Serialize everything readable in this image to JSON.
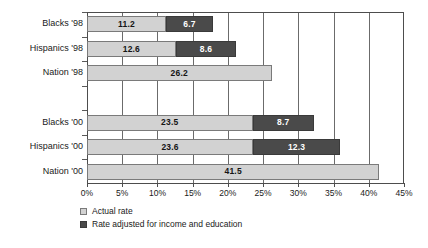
{
  "chart_data": {
    "type": "bar",
    "orientation": "horizontal",
    "stacked": true,
    "title": "",
    "xlabel": "",
    "ylabel": "",
    "xlim": [
      0,
      45
    ],
    "xticks": [
      0,
      5,
      10,
      15,
      20,
      25,
      30,
      35,
      40,
      45
    ],
    "xticklabels": [
      "0%",
      "5%",
      "10%",
      "15%",
      "20%",
      "25%",
      "30%",
      "35%",
      "40%",
      "45%"
    ],
    "grid": true,
    "legend_position": "below-axis-left",
    "categories": [
      "Blacks '98",
      "Hispanics '98",
      "Nation  '98",
      "",
      "Blacks '00",
      "Hispanics '00",
      "Nation '00"
    ],
    "series": [
      {
        "name": "Actual rate",
        "color": "#d2d2d2",
        "values": [
          11.2,
          12.6,
          26.2,
          null,
          23.5,
          23.6,
          41.5
        ],
        "labels": [
          "11.2",
          "12.6",
          "26.2",
          "",
          "23.5",
          "23.6",
          "41.5"
        ]
      },
      {
        "name": "Rate adjusted for income and education",
        "color": "#4a4a4a",
        "values": [
          6.7,
          8.6,
          null,
          null,
          8.7,
          12.3,
          null
        ],
        "labels": [
          "6.7",
          "8.6",
          "",
          "",
          "8.7",
          "12.3",
          ""
        ]
      }
    ]
  },
  "legend": {
    "items": [
      {
        "label": "Actual rate",
        "color": "#d2d2d2"
      },
      {
        "label": "Rate adjusted for income and education",
        "color": "#4a4a4a"
      }
    ]
  },
  "rows": [
    {
      "label": "Blacks '98",
      "light": 11.2,
      "light_label": "11.2",
      "dark": 6.7,
      "dark_label": "6.7"
    },
    {
      "label": "Hispanics '98",
      "light": 12.6,
      "light_label": "12.6",
      "dark": 8.6,
      "dark_label": "8.6"
    },
    {
      "label": "Nation  '98",
      "light": 26.2,
      "light_label": "26.2",
      "dark": 0,
      "dark_label": ""
    },
    {
      "label": "",
      "light": 0,
      "light_label": "",
      "dark": 0,
      "dark_label": ""
    },
    {
      "label": "Blacks '00",
      "light": 23.5,
      "light_label": "23.5",
      "dark": 8.7,
      "dark_label": "8.7"
    },
    {
      "label": "Hispanics '00",
      "light": 23.6,
      "light_label": "23.6",
      "dark": 12.3,
      "dark_label": "12.3"
    },
    {
      "label": "Nation '00",
      "light": 41.5,
      "light_label": "41.5",
      "dark": 0,
      "dark_label": ""
    }
  ]
}
